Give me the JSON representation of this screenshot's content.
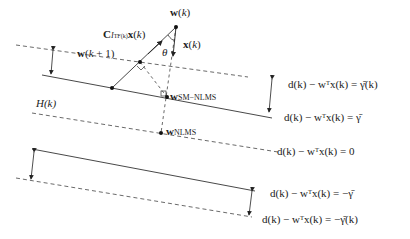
{
  "diagram": {
    "type": "geometric interpretation of set-membership NLMS update",
    "points": {
      "w_k": "w(k)",
      "w_k1": "w(k + 1)",
      "w_sm_nlms": "w_SM−NLMS",
      "w_nlms": "w_NLMS"
    },
    "vectors": {
      "x_k": "x(k)",
      "c_term": "C_{I_TF(k)} x(k)",
      "angle": "θ"
    },
    "set_label": "H(k)",
    "lines": [
      {
        "id": "upper-dashed",
        "style": "dashed",
        "label": "d(k) − wᵀx(k) = γ̄(k)"
      },
      {
        "id": "upper-solid",
        "style": "solid",
        "label": "d(k) − wᵀx(k) = γ̄"
      },
      {
        "id": "center-dashed",
        "style": "dashed",
        "label": "d(k) − wᵀx(k) = 0"
      },
      {
        "id": "lower-solid",
        "style": "solid",
        "label": "d(k) − wᵀx(k) = −γ̄"
      },
      {
        "id": "lower-dashed",
        "style": "dashed",
        "label": "d(k) − wᵀx(k) = −γ̄(k)"
      }
    ]
  },
  "labels": {
    "w_k": "w(k)",
    "w_k1": "w(k + 1)",
    "c_main": "C",
    "c_sub": "I",
    "c_subsub": "TF(k)",
    "c_tail": "x(k)",
    "x_k": "x(k)",
    "theta": "θ",
    "w_sm": "w",
    "w_sm_sub": "SM−NLMS",
    "w_nlms": "w",
    "w_nlms_sub": "NLMS",
    "hk": "H(k)",
    "eq1": "d(k) − wᵀx(k) = γ̄(k)",
    "eq2": "d(k) − wᵀx(k) = γ̄",
    "eq3": "d(k) − wᵀx(k) = 0",
    "eq4": "d(k) − wᵀx(k) = −γ̄",
    "eq5": "d(k) − wᵀx(k) = −γ̄(k)"
  }
}
